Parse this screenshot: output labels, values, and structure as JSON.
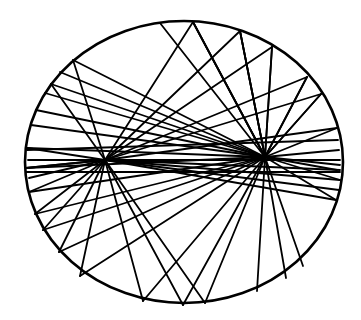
{
  "diagram": {
    "type": "ellipse-focal-reflection",
    "canvas": {
      "width": 361,
      "height": 320
    },
    "colors": {
      "stroke": "#000000",
      "background": "#ffffff"
    },
    "ellipse": {
      "cx": 184,
      "cy": 162,
      "rx": 159,
      "ry": 141
    },
    "foci": [
      {
        "x": 105,
        "y": 160
      },
      {
        "x": 265,
        "y": 157
      }
    ],
    "boundary_points": [
      {
        "x": 193,
        "y": 22
      },
      {
        "x": 240,
        "y": 31
      },
      {
        "x": 272,
        "y": 47
      },
      {
        "x": 307,
        "y": 77
      },
      {
        "x": 321,
        "y": 94
      },
      {
        "x": 337,
        "y": 128
      },
      {
        "x": 340,
        "y": 180
      },
      {
        "x": 336,
        "y": 200
      },
      {
        "x": 303,
        "y": 266
      },
      {
        "x": 286,
        "y": 278
      },
      {
        "x": 257,
        "y": 291
      },
      {
        "x": 205,
        "y": 303
      },
      {
        "x": 183,
        "y": 305
      },
      {
        "x": 143,
        "y": 301
      },
      {
        "x": 80,
        "y": 276
      },
      {
        "x": 59,
        "y": 252
      },
      {
        "x": 43,
        "y": 230
      },
      {
        "x": 35,
        "y": 214
      },
      {
        "x": 29,
        "y": 192
      },
      {
        "x": 26,
        "y": 168
      },
      {
        "x": 27,
        "y": 148
      },
      {
        "x": 31,
        "y": 125
      },
      {
        "x": 36,
        "y": 110
      },
      {
        "x": 45,
        "y": 93
      },
      {
        "x": 51,
        "y": 84
      },
      {
        "x": 60,
        "y": 72
      },
      {
        "x": 73,
        "y": 60
      }
    ],
    "chords": [
      [
        193,
        22,
        105,
        160
      ],
      [
        105,
        160,
        143,
        301
      ],
      [
        193,
        22,
        265,
        157
      ],
      [
        265,
        157,
        205,
        303
      ],
      [
        240,
        31,
        105,
        160
      ],
      [
        105,
        160,
        80,
        276
      ],
      [
        240,
        31,
        265,
        157
      ],
      [
        265,
        157,
        257,
        291
      ],
      [
        272,
        47,
        105,
        160
      ],
      [
        105,
        160,
        59,
        252
      ],
      [
        272,
        47,
        265,
        157
      ],
      [
        265,
        157,
        286,
        278
      ],
      [
        307,
        77,
        105,
        160
      ],
      [
        105,
        160,
        43,
        230
      ],
      [
        307,
        77,
        265,
        157
      ],
      [
        265,
        157,
        303,
        266
      ],
      [
        321,
        94,
        105,
        160
      ],
      [
        105,
        160,
        35,
        214
      ],
      [
        337,
        128,
        105,
        160
      ],
      [
        105,
        160,
        29,
        192
      ],
      [
        340,
        180,
        105,
        160
      ],
      [
        105,
        160,
        26,
        168
      ],
      [
        336,
        200,
        105,
        160
      ],
      [
        105,
        160,
        27,
        148
      ],
      [
        73,
        60,
        105,
        160
      ],
      [
        105,
        160,
        183,
        305
      ],
      [
        73,
        60,
        265,
        157
      ],
      [
        265,
        157,
        336,
        200
      ],
      [
        60,
        72,
        265,
        157
      ],
      [
        265,
        157,
        340,
        180
      ],
      [
        51,
        84,
        105,
        160
      ],
      [
        105,
        160,
        205,
        303
      ],
      [
        51,
        84,
        265,
        157
      ],
      [
        265,
        157,
        337,
        170
      ],
      [
        45,
        93,
        265,
        157
      ],
      [
        265,
        157,
        340,
        165
      ],
      [
        36,
        110,
        265,
        157
      ],
      [
        265,
        157,
        339,
        150
      ],
      [
        31,
        125,
        265,
        157
      ],
      [
        265,
        157,
        337,
        128
      ],
      [
        27,
        148,
        265,
        157
      ],
      [
        265,
        157,
        321,
        94
      ],
      [
        26,
        168,
        265,
        157
      ],
      [
        265,
        157,
        307,
        77
      ],
      [
        29,
        192,
        265,
        157
      ],
      [
        265,
        157,
        240,
        31
      ],
      [
        35,
        214,
        265,
        157
      ],
      [
        265,
        157,
        193,
        22
      ],
      [
        43,
        230,
        265,
        157
      ],
      [
        265,
        157,
        272,
        47
      ],
      [
        59,
        252,
        265,
        157
      ],
      [
        265,
        157,
        321,
        94
      ],
      [
        80,
        276,
        265,
        157
      ],
      [
        265,
        157,
        240,
        31
      ],
      [
        143,
        301,
        265,
        157
      ],
      [
        265,
        157,
        160,
        23
      ],
      [
        183,
        305,
        265,
        157
      ],
      [
        265,
        157,
        193,
        22
      ],
      [
        26,
        168,
        105,
        160
      ],
      [
        105,
        160,
        340,
        170
      ],
      [
        29,
        178,
        105,
        160
      ],
      [
        105,
        160,
        339,
        190
      ],
      [
        28,
        160,
        340,
        160
      ],
      [
        26,
        172,
        340,
        172
      ],
      [
        27,
        150,
        338,
        140
      ]
    ]
  }
}
